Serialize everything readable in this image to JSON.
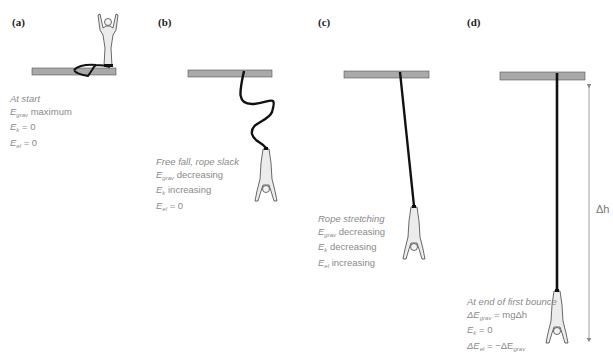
{
  "figure": {
    "colors": {
      "platform": "#a9a9a9",
      "platform_border": "#555555",
      "rope": "#111111",
      "text": "#8a8a8a",
      "figure_fill": "#ececec"
    },
    "panels": [
      {
        "label": "(a)",
        "title": "At start",
        "lines": [
          {
            "sym": "E",
            "sub": "grav",
            "text": "maximum"
          },
          {
            "sym": "E",
            "sub": "k",
            "text": "= 0"
          },
          {
            "sym": "E",
            "sub": "el",
            "text": "= 0"
          }
        ]
      },
      {
        "label": "(b)",
        "title": "Free fall, rope slack",
        "lines": [
          {
            "sym": "E",
            "sub": "grav",
            "text": "decreasing"
          },
          {
            "sym": "E",
            "sub": "k",
            "text": "increasing"
          },
          {
            "sym": "E",
            "sub": "el",
            "text": "= 0"
          }
        ]
      },
      {
        "label": "(c)",
        "title": "Rope stretching",
        "lines": [
          {
            "sym": "E",
            "sub": "grav",
            "text": "decreasing"
          },
          {
            "sym": "E",
            "sub": "k",
            "text": "decreasing"
          },
          {
            "sym": "E",
            "sub": "el",
            "text": "increasing"
          }
        ]
      },
      {
        "label": "(d)",
        "title": "At end of first bounce",
        "lines": [
          {
            "sym": "ΔE",
            "sub": "grav",
            "text": "= mgΔh"
          },
          {
            "sym": "E",
            "sub": "k",
            "text": "= 0"
          },
          {
            "sym": "ΔE",
            "sub": "el",
            "text": "= −ΔE",
            "sub2": "grav"
          }
        ],
        "arrow_label": "Δh"
      }
    ]
  }
}
